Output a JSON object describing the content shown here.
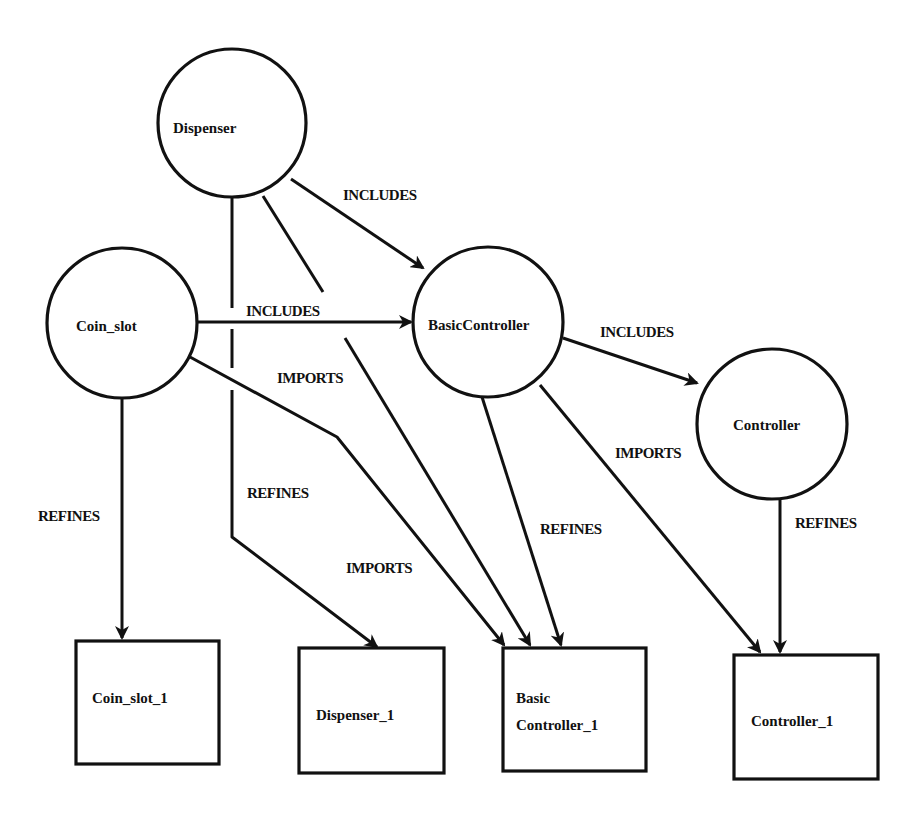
{
  "diagram": {
    "type": "module dependency graph",
    "colors": {
      "stroke": "#111111",
      "background": "#ffffff"
    },
    "nodes": [
      {
        "id": "dispenser",
        "label": "Dispenser",
        "shape": "circle",
        "cx": 232,
        "cy": 123,
        "r": 74
      },
      {
        "id": "coin_slot",
        "label": "Coin_slot",
        "shape": "circle",
        "cx": 122,
        "cy": 323,
        "r": 75
      },
      {
        "id": "basic_controller",
        "label": "BasicController",
        "shape": "circle",
        "cx": 488,
        "cy": 322,
        "r": 75
      },
      {
        "id": "controller",
        "label": "Controller",
        "shape": "circle",
        "cx": 772,
        "cy": 424,
        "r": 75
      },
      {
        "id": "coin_slot_1",
        "label": "Coin_slot_1",
        "shape": "box",
        "x": 76,
        "y": 641,
        "w": 143,
        "h": 123
      },
      {
        "id": "dispenser_1",
        "label": "Dispenser_1",
        "shape": "box",
        "x": 299,
        "y": 648,
        "w": 145,
        "h": 125
      },
      {
        "id": "basic_controller_1",
        "label_line1": "Basic",
        "label_line2": "Controller_1",
        "shape": "box",
        "x": 503,
        "y": 648,
        "w": 143,
        "h": 123
      },
      {
        "id": "controller_1",
        "label": "Controller_1",
        "shape": "box",
        "x": 734,
        "y": 655,
        "w": 144,
        "h": 124
      }
    ],
    "edges": [
      {
        "from": "dispenser",
        "to": "basic_controller",
        "label": "INCLUDES"
      },
      {
        "from": "coin_slot",
        "to": "basic_controller",
        "label": "INCLUDES"
      },
      {
        "from": "basic_controller",
        "to": "controller",
        "label": "INCLUDES"
      },
      {
        "from": "coin_slot",
        "to": "basic_controller_1",
        "label": "IMPORTS"
      },
      {
        "from": "dispenser",
        "to": "basic_controller_1",
        "label": "IMPORTS"
      },
      {
        "from": "basic_controller",
        "to": "controller_1",
        "label": "IMPORTS"
      },
      {
        "from": "coin_slot",
        "to": "coin_slot_1",
        "label": "REFINES"
      },
      {
        "from": "dispenser",
        "to": "dispenser_1",
        "label": "REFINES"
      },
      {
        "from": "basic_controller",
        "to": "basic_controller_1",
        "label": "REFINES"
      },
      {
        "from": "controller",
        "to": "controller_1",
        "label": "REFINES"
      }
    ]
  }
}
